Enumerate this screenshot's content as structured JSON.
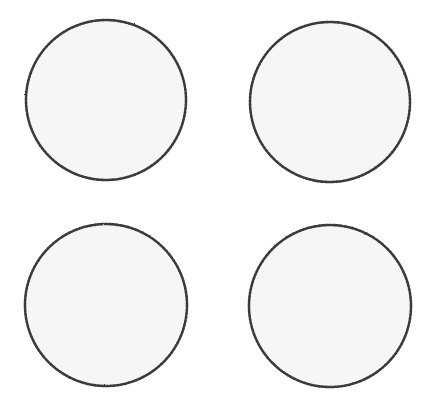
{
  "scene": {
    "background": "#ffffff",
    "width": 432,
    "height": 415,
    "description": "Four hand-drawn circles with beaded outlines arranged in a 2x2 grid",
    "style": {
      "fill": "#f6f6f6",
      "stroke": "#3a3a3a",
      "stroke_light": "#6a6a6a"
    },
    "circles": [
      {
        "id": "top-left",
        "cx": 106,
        "cy": 100,
        "r": 80
      },
      {
        "id": "top-right",
        "cx": 330,
        "cy": 102,
        "r": 80
      },
      {
        "id": "bottom-left",
        "cx": 106,
        "cy": 305,
        "r": 81
      },
      {
        "id": "bottom-right",
        "cx": 330,
        "cy": 306,
        "r": 81
      }
    ]
  }
}
